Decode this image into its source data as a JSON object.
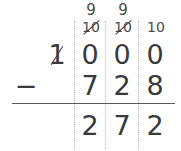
{
  "problem": {
    "type": "vertical-subtraction-with-regrouping",
    "minuend": "1000",
    "subtrahend": "728",
    "difference": "272",
    "operator": "−",
    "columns": [
      "thousands",
      "hundreds",
      "tens",
      "ones"
    ]
  },
  "minuend_row": {
    "thousands": "1",
    "hundreds": "0",
    "tens": "0",
    "ones": "0"
  },
  "subtrahend_row": {
    "thousands": "",
    "hundreds": "7",
    "tens": "2",
    "ones": "8"
  },
  "difference_row": {
    "thousands": "",
    "hundreds": "2",
    "tens": "7",
    "ones": "2"
  },
  "regrouping": {
    "hundreds_top": "9",
    "hundreds_bottom": "10",
    "tens_top": "9",
    "tens_bottom": "10",
    "ones_bottom": "10"
  },
  "colors": {
    "digit": "#3a3a3a",
    "annotation": "#4a4a4a",
    "rule": "#5a5a5a",
    "separator": "#b9b9b9",
    "background": "#ffffff"
  }
}
